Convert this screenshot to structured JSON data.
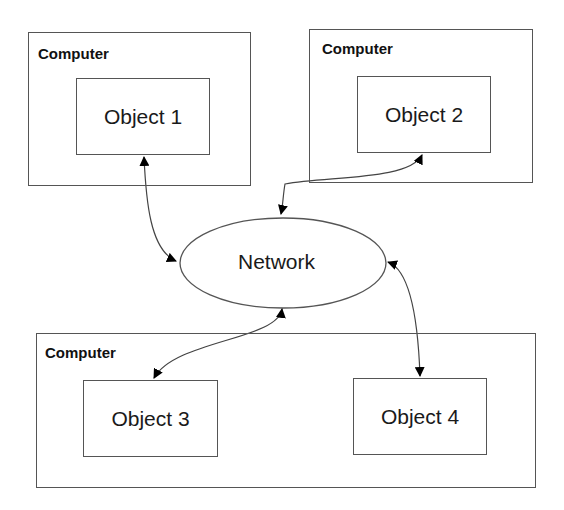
{
  "diagram": {
    "type": "distributed-objects",
    "computers": [
      {
        "label": "Computer",
        "objects": [
          "Object 1"
        ]
      },
      {
        "label": "Computer",
        "objects": [
          "Object 2"
        ]
      },
      {
        "label": "Computer",
        "objects": [
          "Object 3",
          "Object 4"
        ]
      }
    ],
    "network": {
      "label": "Network"
    },
    "connections": [
      {
        "from": "Object 1",
        "to": "Network",
        "bidirectional": true
      },
      {
        "from": "Object 2",
        "to": "Network",
        "bidirectional": true
      },
      {
        "from": "Object 3",
        "to": "Network",
        "bidirectional": true
      },
      {
        "from": "Object 4",
        "to": "Network",
        "bidirectional": true
      }
    ],
    "colors": {
      "stroke": "#555555",
      "text": "#1a1a1a",
      "background": "#ffffff"
    }
  }
}
